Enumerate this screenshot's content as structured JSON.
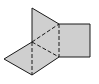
{
  "diagram": {
    "title": "",
    "colors": {
      "fill": "#cfcfcf",
      "stroke": "#1a1a1a",
      "background": "#ffffff"
    },
    "planes": [
      {
        "name": "vertical-plane",
        "points": "32,8 59,24 59,57 32,75 32,42"
      },
      {
        "name": "square-plane",
        "points": "59,24 90,24 90,57 59,57"
      },
      {
        "name": "rhombus-plane",
        "points": "4,59 32,42 59,57 32,75"
      }
    ],
    "solid_edges": [
      {
        "x1": 32,
        "y1": 8,
        "x2": 59,
        "y2": 24
      },
      {
        "x1": 59,
        "y1": 24,
        "x2": 90,
        "y2": 24
      },
      {
        "x1": 90,
        "y1": 24,
        "x2": 90,
        "y2": 57
      },
      {
        "x1": 90,
        "y1": 57,
        "x2": 59,
        "y2": 57
      },
      {
        "x1": 32,
        "y1": 8,
        "x2": 32,
        "y2": 42
      },
      {
        "x1": 4,
        "y1": 59,
        "x2": 32,
        "y2": 42
      },
      {
        "x1": 4,
        "y1": 59,
        "x2": 32,
        "y2": 75
      },
      {
        "x1": 32,
        "y1": 75,
        "x2": 59,
        "y2": 57
      }
    ],
    "dashed_edges": [
      {
        "x1": 32,
        "y1": 42,
        "x2": 59,
        "y2": 24
      },
      {
        "x1": 59,
        "y1": 24,
        "x2": 59,
        "y2": 57
      },
      {
        "x1": 32,
        "y1": 42,
        "x2": 32,
        "y2": 75
      },
      {
        "x1": 32,
        "y1": 42,
        "x2": 59,
        "y2": 57
      }
    ]
  }
}
